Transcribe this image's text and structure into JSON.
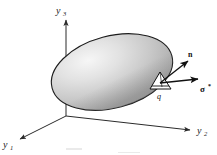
{
  "figure": {
    "background_color": "#ffffff",
    "axes": {
      "vertical": {
        "name": "y3-axis",
        "label_base": "y",
        "label_sub": "3"
      },
      "right": {
        "name": "y2-axis",
        "label_base": "y",
        "label_sub": "2"
      },
      "left": {
        "name": "y1-axis",
        "label_base": "y",
        "label_sub": "1"
      },
      "line_color": "#2b2b2b"
    },
    "body": {
      "name": "ellipsoid-body",
      "fill_light": "#f2f2f2",
      "fill_mid": "#c9c9c9",
      "fill_dark": "#9a9a9a",
      "outline_color": "#1c1c1c"
    },
    "annotations": {
      "normal_vector_label": "n",
      "traction_vector_label": "σ",
      "traction_superscript": "*",
      "point_label": "q",
      "surface_element_name": "surface-element-wedge"
    }
  }
}
